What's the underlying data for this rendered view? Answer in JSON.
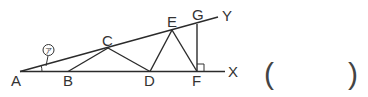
{
  "diagram": {
    "points": {
      "A": {
        "label": "A"
      },
      "B": {
        "label": "B"
      },
      "C": {
        "label": "C"
      },
      "D": {
        "label": "D"
      },
      "E": {
        "label": "E"
      },
      "F": {
        "label": "F"
      },
      "G": {
        "label": "G"
      }
    },
    "rays": {
      "X": {
        "label": "X"
      },
      "Y": {
        "label": "Y"
      }
    },
    "angle_marker": {
      "label": "㋐"
    },
    "answer_box": {
      "open": "(",
      "close": ")"
    }
  }
}
